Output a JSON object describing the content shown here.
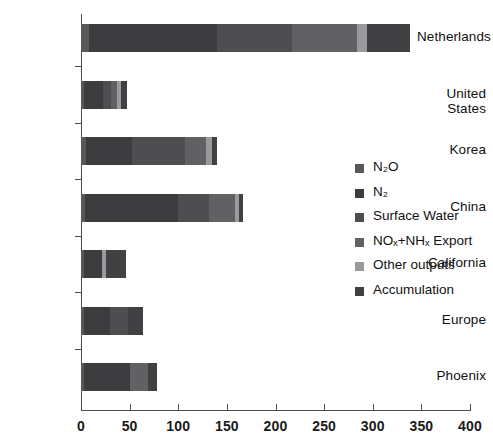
{
  "chart_data": {
    "type": "bar",
    "orientation": "horizontal",
    "stacked": true,
    "title": "",
    "xlabel": "",
    "ylabel": "",
    "xlim": [
      0,
      400
    ],
    "xticks": [
      0,
      50,
      100,
      150,
      200,
      250,
      300,
      350,
      400
    ],
    "xtick_labels": [
      "0",
      "50",
      "100",
      "150",
      "200",
      "250",
      "300",
      "350",
      "400"
    ],
    "grid": false,
    "legend_position": "center-right",
    "categories": [
      "Netherlands",
      "United States",
      "Korea",
      "China",
      "California",
      "Europe",
      "Phoenix"
    ],
    "series": [
      {
        "name": "N2O",
        "label": "N₂O",
        "color": "#58585a",
        "values": [
          8,
          3,
          5,
          4,
          3,
          3,
          3
        ]
      },
      {
        "name": "N2",
        "label": "N₂",
        "color": "#3c3c3e",
        "values": [
          132,
          20,
          47,
          96,
          19,
          27,
          47
        ]
      },
      {
        "name": "Surface Water",
        "label": "Surface Water",
        "color": "#4e4e50",
        "values": [
          77,
          8,
          55,
          32,
          0,
          18,
          0
        ]
      },
      {
        "name": "NOx+NHx Export",
        "label": "NOₓ+NHₓ Export",
        "color": "#616163",
        "values": [
          67,
          6,
          22,
          26,
          0,
          0,
          19
        ]
      },
      {
        "name": "Other outputs",
        "label": "Other outputs",
        "color": "#9a9a9c",
        "values": [
          10,
          4,
          6,
          4,
          4,
          0,
          0
        ]
      },
      {
        "name": "Accumulation",
        "label": "Accumulation",
        "color": "#414143",
        "values": [
          44,
          6,
          5,
          5,
          20,
          16,
          9
        ]
      }
    ],
    "totals": [
      338,
      47,
      140,
      167,
      46,
      64,
      78
    ]
  }
}
